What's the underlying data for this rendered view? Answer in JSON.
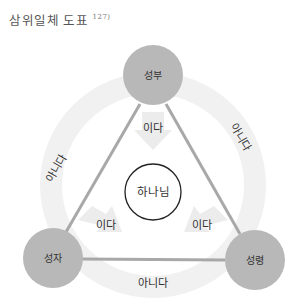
{
  "title": {
    "text": "삼위일체 도표",
    "footnote": "127)"
  },
  "nodes": {
    "father": {
      "label": "성부",
      "color": "#b8b8b8"
    },
    "son": {
      "label": "성자",
      "color": "#b8b8b8"
    },
    "spirit": {
      "label": "성령",
      "color": "#b8b8b8"
    },
    "god": {
      "label": "하나님",
      "color": "#ffffff",
      "stroke": "#222222"
    }
  },
  "edges": {
    "father_son": {
      "label": "아니다"
    },
    "father_spirit": {
      "label": "아니다"
    },
    "son_spirit": {
      "label": "아니다"
    }
  },
  "arrows": {
    "father_god": {
      "label": "이다"
    },
    "son_god": {
      "label": "이다"
    },
    "spirit_god": {
      "label": "이다"
    }
  },
  "colors": {
    "line": "#a8a8a8",
    "ring": "#f2f2f2",
    "arrow": "#ebebeb"
  }
}
